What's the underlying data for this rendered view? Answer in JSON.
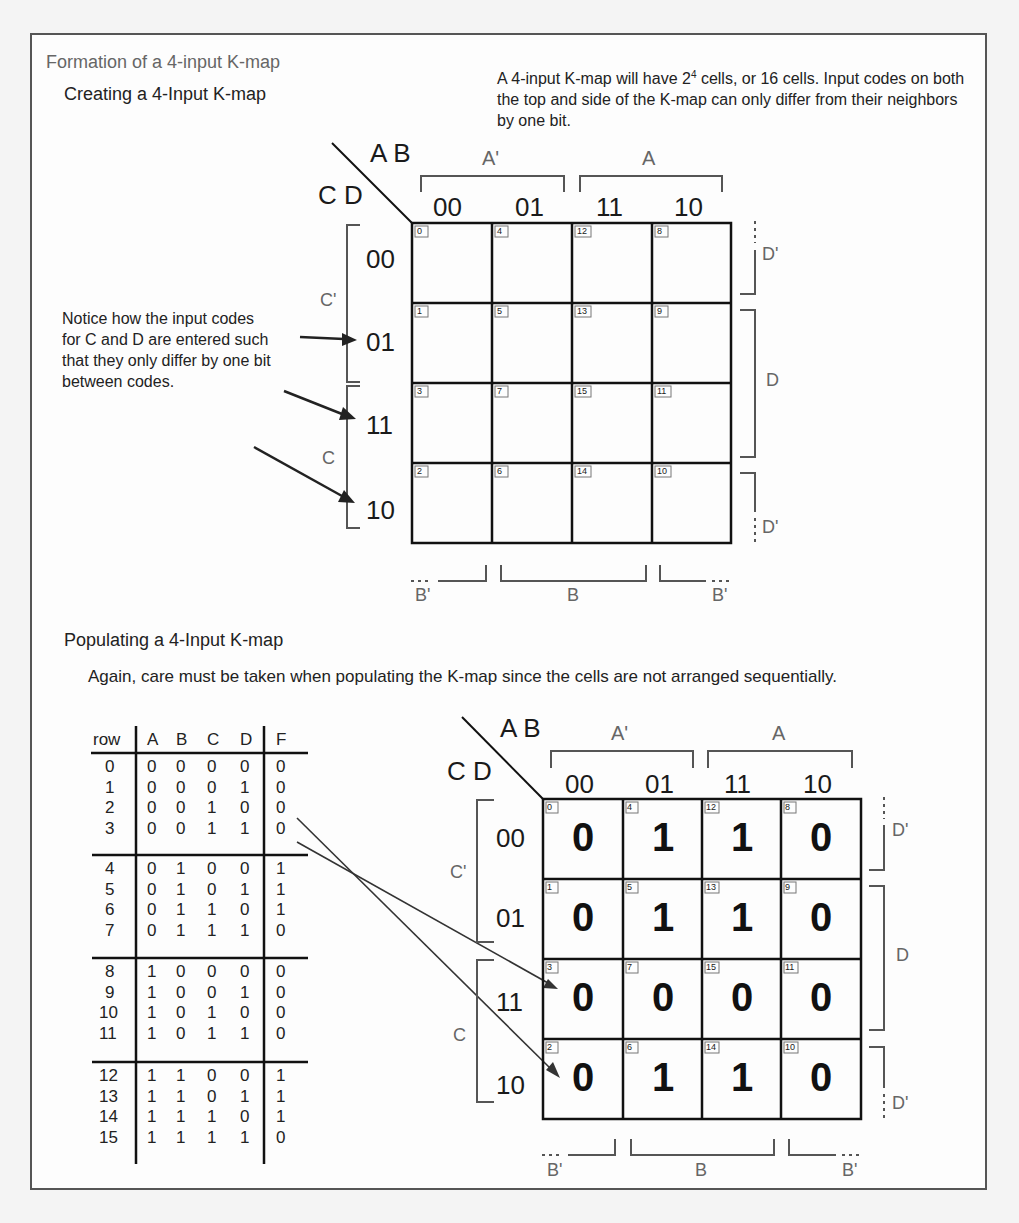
{
  "header": {
    "title": "Formation of a 4-input K-map"
  },
  "section1": {
    "heading": "Creating a 4-Input K-map",
    "description_pre": "A 4-input K-map will have 2",
    "description_sup": "4",
    "description_post": " cells, or 16 cells.  Input codes on both the top and side of the K-map can only differ from their neighbors by one bit.",
    "note": "Notice how the input codes for C and D are entered such that they only differ by one bit between codes.",
    "kmap": {
      "top_var": "A B",
      "side_var": "C D",
      "col_codes": [
        "00",
        "01",
        "11",
        "10"
      ],
      "row_codes": [
        "00",
        "01",
        "11",
        "10"
      ],
      "top_groups": [
        "A'",
        "A"
      ],
      "bottom_groups": [
        "B'",
        "B",
        "B'"
      ],
      "left_groups": [
        "C'",
        "C"
      ],
      "right_groups": [
        "D'",
        "D",
        "D'"
      ],
      "cell_indices": [
        [
          "0",
          "4",
          "12",
          "8"
        ],
        [
          "1",
          "5",
          "13",
          "9"
        ],
        [
          "3",
          "7",
          "15",
          "11"
        ],
        [
          "2",
          "6",
          "14",
          "10"
        ]
      ]
    }
  },
  "section2": {
    "heading": "Populating a 4-Input K-map",
    "description": "Again, care must be taken when populating the K-map since the cells are not arranged sequentially.",
    "truth_table": {
      "headers": [
        "row",
        "A",
        "B",
        "C",
        "D",
        "F"
      ],
      "rows": [
        [
          "0",
          "0",
          "0",
          "0",
          "0",
          "0"
        ],
        [
          "1",
          "0",
          "0",
          "0",
          "1",
          "0"
        ],
        [
          "2",
          "0",
          "0",
          "1",
          "0",
          "0"
        ],
        [
          "3",
          "0",
          "0",
          "1",
          "1",
          "0"
        ],
        [
          "4",
          "0",
          "1",
          "0",
          "0",
          "1"
        ],
        [
          "5",
          "0",
          "1",
          "0",
          "1",
          "1"
        ],
        [
          "6",
          "0",
          "1",
          "1",
          "0",
          "1"
        ],
        [
          "7",
          "0",
          "1",
          "1",
          "1",
          "0"
        ],
        [
          "8",
          "1",
          "0",
          "0",
          "0",
          "0"
        ],
        [
          "9",
          "1",
          "0",
          "0",
          "1",
          "0"
        ],
        [
          "10",
          "1",
          "0",
          "1",
          "0",
          "0"
        ],
        [
          "11",
          "1",
          "0",
          "1",
          "1",
          "0"
        ],
        [
          "12",
          "1",
          "1",
          "0",
          "0",
          "1"
        ],
        [
          "13",
          "1",
          "1",
          "0",
          "1",
          "1"
        ],
        [
          "14",
          "1",
          "1",
          "1",
          "0",
          "1"
        ],
        [
          "15",
          "1",
          "1",
          "1",
          "1",
          "0"
        ]
      ]
    },
    "kmap": {
      "top_var": "A B",
      "side_var": "C D",
      "col_codes": [
        "00",
        "01",
        "11",
        "10"
      ],
      "row_codes": [
        "00",
        "01",
        "11",
        "10"
      ],
      "top_groups": [
        "A'",
        "A"
      ],
      "bottom_groups": [
        "B'",
        "B",
        "B'"
      ],
      "left_groups": [
        "C'",
        "C"
      ],
      "right_groups": [
        "D'",
        "D",
        "D'"
      ],
      "cell_indices": [
        [
          "0",
          "4",
          "12",
          "8"
        ],
        [
          "1",
          "5",
          "13",
          "9"
        ],
        [
          "3",
          "7",
          "15",
          "11"
        ],
        [
          "2",
          "6",
          "14",
          "10"
        ]
      ],
      "cell_values": [
        [
          "0",
          "1",
          "1",
          "0"
        ],
        [
          "0",
          "1",
          "1",
          "0"
        ],
        [
          "0",
          "0",
          "0",
          "0"
        ],
        [
          "0",
          "1",
          "1",
          "0"
        ]
      ]
    }
  }
}
